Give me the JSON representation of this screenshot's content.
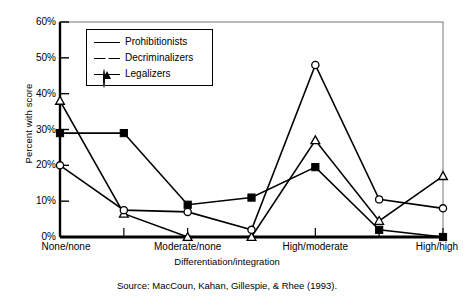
{
  "chart_data": {
    "type": "line",
    "title": "",
    "xlabel": "Differentiation/integration",
    "ylabel": "Percent with score",
    "ylim": [
      0,
      60
    ],
    "ytick_labels": [
      "0%",
      "10%",
      "20%",
      "30%",
      "40%",
      "50%",
      "60%"
    ],
    "ytick_values": [
      0,
      10,
      20,
      30,
      40,
      50,
      60
    ],
    "x": [
      0,
      1,
      2,
      3,
      4,
      5,
      6
    ],
    "xtick_labels": [
      "None/none",
      "Moderate/none",
      "High/moderate",
      "High/high"
    ],
    "xtick_label_positions": [
      0,
      2,
      4,
      6
    ],
    "grid": false,
    "legend_position": "upper-left-inside",
    "series": [
      {
        "name": "Prohibitionists",
        "marker": "filled-square",
        "values": [
          29,
          29,
          9,
          11,
          19.5,
          2,
          0
        ]
      },
      {
        "name": "Decriminalizers",
        "marker": "open-triangle",
        "values": [
          38,
          6.5,
          0,
          0,
          27,
          4.5,
          17
        ]
      },
      {
        "name": "Legalizers",
        "marker": "open-circle",
        "values": [
          20,
          7.5,
          7,
          2,
          48,
          10.5,
          8
        ]
      }
    ]
  },
  "caption": {
    "source": "Source: MacCoun, Kahan, Gillespie, & Rhee (1993)."
  },
  "colors": {
    "line": "#000000",
    "axis": "#000000",
    "background": "#ffffff"
  }
}
